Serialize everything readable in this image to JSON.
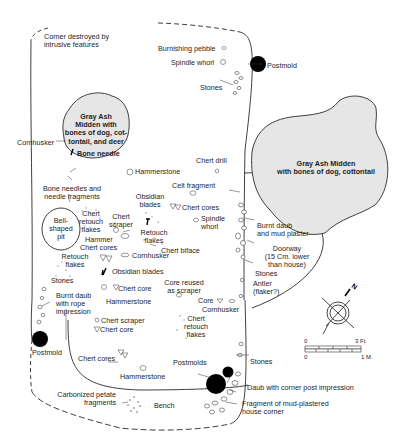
{
  "diagram": {
    "type": "archaeological house floor plan",
    "colors": {
      "midden_fill": "#e6e6e6",
      "line": "#2a2a2a",
      "postmold": "#000000"
    },
    "middens": [
      {
        "id": "midden-west",
        "label": "Gray Ash\nMidden with\nbones of dog, cot-\ntontail, and deer"
      },
      {
        "id": "midden-east",
        "label": "Gray Ash Midden\nwith bones of dog, cottontail"
      }
    ],
    "labels": {
      "corner_destroyed": "Corner destroyed by\nintrusive features",
      "burnishing_pebble": "Burnishing pebble",
      "spindle_whorl_top": "Spindle whorl",
      "postmold_top": "Postmold",
      "stones_top": "Stones",
      "cornhusker_west": "Cornhusker",
      "bone_needle": "Bone needle",
      "hammerstone_top": "Hammerstone",
      "chert_drill": "Chert drill",
      "celt_fragment": "Celt fragment",
      "obsidian_blades_top": "Obsidian\nblades",
      "chert_cores_top": "Chert cores",
      "spindle_whorl_mid": "Spindle\nwhorl",
      "bone_needles_fragments": "Bone needles and\nneedle fragments",
      "chert_retouch_flakes_west": "Chert\nretouch\nflakes",
      "chert_scraper_top": "Chert\nscraper",
      "retouch_flakes_mid": "Retouch\nflakes",
      "bell_shaped_pit": "Bell-\nshaped\npit",
      "hammer": "Hammer",
      "chert_cores_west": "Chert cores",
      "chert_biface": "Chert biface",
      "cornhusker_mid": "Cornhusker",
      "retouch_flakes_west": "Retouch\nflakes",
      "obsidian_blades_mid": "Obsidian blades",
      "burnt_daub_mud_plaster": "Burnt daub\nand mud plaster",
      "doorway": "Doorway\n(15 Cm. lower\nthan house)",
      "stones_door": "Stones",
      "antler": "Antler\n(flaker?)",
      "stones_west": "Stones",
      "chert_core_mid": "Chert core",
      "core_reused": "Core reused\nas scraper",
      "burnt_daub_rope": "Burnt daub\nwith rope\nimpression",
      "hammerstone_mid": "Hammerstone",
      "core": "Core",
      "cornhusker_east": "Cornhusker",
      "chert_scraper_low": "Chert scraper",
      "chert_core_low": "Chert core",
      "chert_retouch_flakes_east": "Chert\nretouch\nflakes",
      "postmold_west": "Postmold",
      "chert_cores_low": "Chert cores",
      "postmolds": "Postmolds",
      "stones_east": "Stones",
      "hammerstone_low": "Hammerstone",
      "daub_corner_post": "Daub with corner post impression",
      "carbonized_petate": "Carbonized petate\nfragments",
      "bench": "Bench",
      "fragment_mud_plastered": "Fragment of mud-plastered\nhouse corner"
    },
    "north_arrow": {
      "label": "N"
    },
    "scale_bar": {
      "top_left": "0",
      "top_right": "3 Ft.",
      "bottom_left": "0",
      "bottom_right": "1 M."
    }
  }
}
